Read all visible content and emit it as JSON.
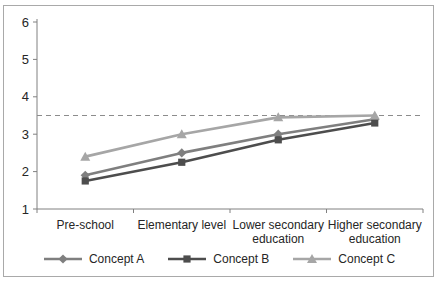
{
  "chart_data": {
    "type": "line",
    "title": "",
    "categories": [
      "Pre-school",
      "Elementary level",
      "Lower secondary\neducation",
      "Higher secondary\neducation"
    ],
    "series": [
      {
        "name": "Concept A",
        "marker": "diamond",
        "color": "#7f7f7f",
        "values": [
          1.9,
          2.5,
          3.0,
          3.4
        ]
      },
      {
        "name": "Concept B",
        "marker": "square",
        "color": "#4d4d4d",
        "values": [
          1.75,
          2.25,
          2.85,
          3.3
        ]
      },
      {
        "name": "Concept C",
        "marker": "triangle",
        "color": "#a6a6a6",
        "values": [
          2.4,
          3.0,
          3.45,
          3.5
        ]
      }
    ],
    "reference_line": {
      "value": 3.5,
      "style": "dashed",
      "color": "#8c8c8c"
    },
    "yticks": [
      "1",
      "2",
      "3",
      "4",
      "5",
      "6"
    ],
    "ylim": [
      1,
      6
    ],
    "xlabel": "",
    "ylabel": "",
    "legend_position": "bottom",
    "grid": false
  },
  "frame": {
    "border_color": "#a9a9a9",
    "background": "#ffffff"
  },
  "axis": {
    "line_color": "#808080",
    "text_color": "#262626"
  }
}
